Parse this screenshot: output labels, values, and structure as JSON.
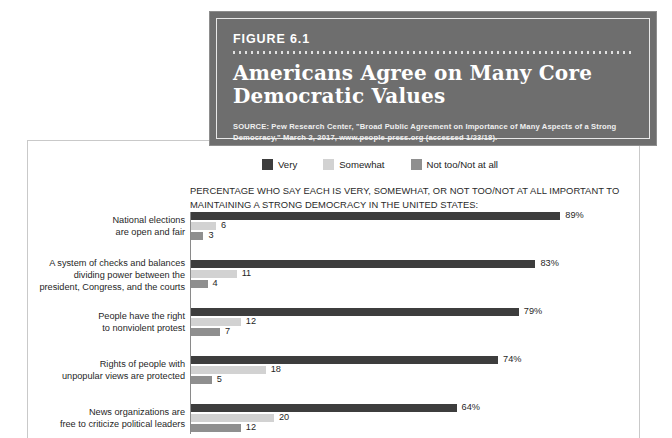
{
  "figure": {
    "number": "FIGURE 6.1",
    "title": "Americans Agree on Many Core Democratic Values",
    "source": "SOURCE: Pew Research Center, \"Broad Public Agreement on Importance of Many Aspects of a Strong Democracy,\" March 2, 2017, www.people-press.org (accessed 1/23/18).",
    "box_color": "#6e6e6e"
  },
  "chart_data": {
    "type": "bar",
    "orientation": "horizontal",
    "title": "Americans Agree on Many Core Democratic Values",
    "subtitle": "PERCENTAGE WHO SAY EACH IS VERY, SOMEWHAT, OR NOT TOO/NOT AT ALL IMPORTANT TO MAINTAINING A STRONG DEMOCRACY IN THE UNITED STATES:",
    "xlabel": "",
    "ylabel": "",
    "xlim": [
      0,
      100
    ],
    "grid": false,
    "legend_position": "top",
    "legend": [
      "Very",
      "Somewhat",
      "Not too/Not at all"
    ],
    "colors": [
      "#3d3d3d",
      "#d2d2d2",
      "#8f8f8f"
    ],
    "categories": [
      "National elections are open and fair",
      "A system of checks and balances dividing power between the president, Congress, and the courts",
      "People have the right to nonviolent protest",
      "Rights of people with unpopular views are protected",
      "News organizations are free to criticize political leaders"
    ],
    "category_lines": [
      [
        "National elections",
        "are open and fair"
      ],
      [
        "A system of checks and balances",
        "dividing power between the",
        "president, Congress, and the courts"
      ],
      [
        "People have the right",
        "to nonviolent protest"
      ],
      [
        "Rights of people with",
        "unpopular views are protected"
      ],
      [
        "News organizations are",
        "free to criticize political leaders"
      ]
    ],
    "series": [
      {
        "name": "Very",
        "values": [
          89,
          83,
          79,
          74,
          64
        ],
        "labels": [
          "89%",
          "83%",
          "79%",
          "74%",
          "64%"
        ]
      },
      {
        "name": "Somewhat",
        "values": [
          6,
          11,
          12,
          18,
          20
        ],
        "labels": [
          "6",
          "11",
          "12",
          "18",
          "20"
        ]
      },
      {
        "name": "Not too/Not at all",
        "values": [
          3,
          4,
          7,
          5,
          12
        ],
        "labels": [
          "3",
          "4",
          "7",
          "5",
          "12"
        ]
      }
    ]
  }
}
